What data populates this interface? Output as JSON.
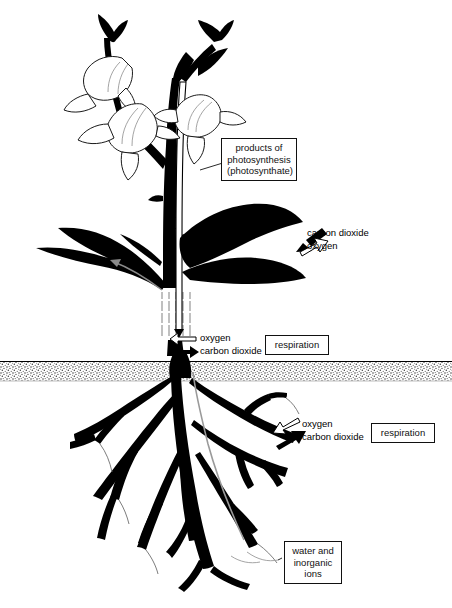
{
  "diagram": {
    "background_color": "#ffffff",
    "ink_color": "#000000",
    "soil_color": "#d9d9d9"
  },
  "callouts": {
    "photosynthate": {
      "line1": "products of",
      "line2": "photosynthesis",
      "line3": "(photosynthate)"
    },
    "respiration_stem": {
      "label": "respiration"
    },
    "respiration_root": {
      "label": "respiration"
    },
    "water_ions": {
      "line1": "water and",
      "line2": "inorganic",
      "line3": "ions"
    }
  },
  "gas_labels": {
    "leaf": {
      "carbon_dioxide": "carbon dioxide",
      "oxygen": "oxygen"
    },
    "stem": {
      "oxygen": "oxygen",
      "carbon_dioxide": "carbon dioxide"
    },
    "root": {
      "oxygen": "oxygen",
      "carbon_dioxide": "carbon dioxide"
    }
  },
  "parts": {
    "flowers": "flowers",
    "leaves": "leaves",
    "stem": "stem",
    "stem_cutaway": "stem-cutaway-vessels",
    "soil_band": "soil",
    "roots": "root-system",
    "phloem_channel": "phloem-transport-channel",
    "xylem_channel": "xylem-transport-channel"
  }
}
